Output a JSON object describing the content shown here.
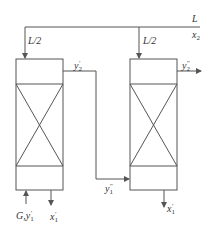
{
  "diagram": {
    "colors": {
      "stroke": "#555555",
      "text": "#333333"
    },
    "feed": {
      "symbol": "L",
      "composition": "x",
      "composition_sub": "2"
    },
    "split_left": "L/2",
    "split_right": "L/2",
    "left_column": {
      "gas_inlet": {
        "symbol": "G,y",
        "sub": "1",
        "sup": "′"
      },
      "gas_outlet": {
        "symbol": "y",
        "sub": "2",
        "sup": "′"
      },
      "liquid_outlet": {
        "symbol": "x",
        "sub": "1",
        "sup": "′"
      }
    },
    "right_column": {
      "gas_inlet": {
        "symbol": "y",
        "sub": "1",
        "sup": "″"
      },
      "gas_outlet": {
        "symbol": "y",
        "sub": "2",
        "sup": "″"
      },
      "liquid_outlet": {
        "symbol": "x",
        "sub": "1",
        "sup": "′"
      }
    }
  }
}
